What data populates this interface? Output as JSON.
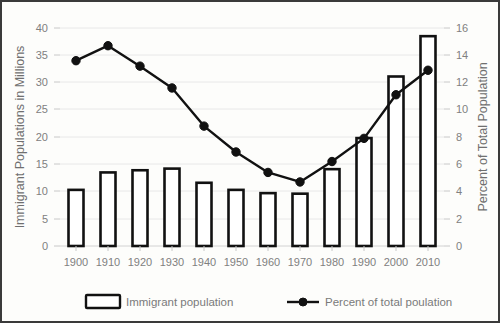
{
  "chart_data": {
    "type": "bar",
    "title": "",
    "subtitle": "",
    "xlabel": "",
    "ylabel": "Immigrant Populations in Millions",
    "y2label": "Percent of Total Population",
    "categories": [
      "1900",
      "1910",
      "1920",
      "1930",
      "1940",
      "1950",
      "1960",
      "1970",
      "1980",
      "1990",
      "2000",
      "2010"
    ],
    "ylim": [
      0,
      40
    ],
    "yticks": [
      "0",
      "5",
      "10",
      "15",
      "20",
      "25",
      "30",
      "35",
      "40"
    ],
    "y2lim": [
      0,
      16
    ],
    "y2ticks": [
      "0",
      "2",
      "4",
      "6",
      "8",
      "10",
      "12",
      "14",
      "16"
    ],
    "grid": true,
    "legend_position": "bottom",
    "series": [
      {
        "name": "Immigrant population",
        "type": "bar",
        "axis": "left",
        "unit": "millions",
        "values": [
          10.3,
          13.5,
          13.9,
          14.2,
          11.6,
          10.3,
          9.7,
          9.6,
          14.1,
          19.8,
          31.1,
          38.5
        ]
      },
      {
        "name": "Percent of total poulation",
        "type": "line",
        "axis": "right",
        "unit": "percent",
        "values": [
          13.6,
          14.7,
          13.2,
          11.6,
          8.8,
          6.9,
          5.4,
          4.7,
          6.2,
          7.9,
          11.1,
          12.9
        ]
      }
    ]
  },
  "legend": {
    "items": [
      {
        "label": "Immigrant population",
        "marker": "bar-outline-swatch"
      },
      {
        "label": "Percent of total poulation",
        "marker": "line-dot-swatch"
      }
    ]
  },
  "colors": {
    "ink": "#111111",
    "grid": "#e8e8e8",
    "tick_text": "#808080",
    "axis_title_text": "#6f6f6f",
    "frame": "#3a3a3a",
    "background": "#fdfdfb"
  }
}
